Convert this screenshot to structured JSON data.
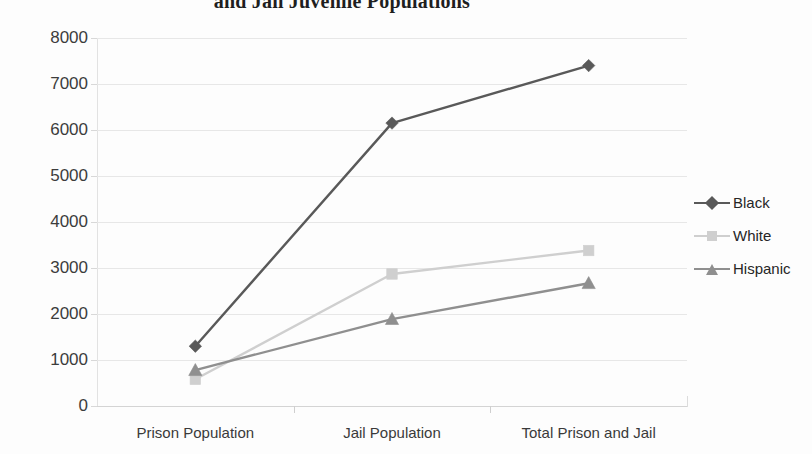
{
  "chart_data": {
    "type": "line",
    "title": "and Jail Juvenile Populations",
    "title_superscript": "2",
    "title_note": "Title is clipped at the top edge of the screenshot; only the second line is visible.",
    "xlabel": "",
    "ylabel": "",
    "categories": [
      "Prison Population",
      "Jail Population",
      "Total Prison and Jail"
    ],
    "ylim": [
      0,
      8000
    ],
    "ytick_step": 1000,
    "ytick_labels": [
      "8000",
      "7000",
      "6000",
      "5000",
      "4000",
      "3000",
      "2000",
      "1000",
      "0"
    ],
    "grid": true,
    "legend_position": "right",
    "series": [
      {
        "name": "Black",
        "values": [
          1300,
          6150,
          7400
        ],
        "color": "#595959",
        "marker": "diamond"
      },
      {
        "name": "White",
        "values": [
          580,
          2870,
          3380
        ],
        "color": "#cfcfcf",
        "marker": "square"
      },
      {
        "name": "Hispanic",
        "values": [
          780,
          1890,
          2670
        ],
        "color": "#8f8f8f",
        "marker": "triangle"
      }
    ]
  },
  "axis": {
    "y_ticks": [
      {
        "label": "8000",
        "value": 8000
      },
      {
        "label": "7000",
        "value": 7000
      },
      {
        "label": "6000",
        "value": 6000
      },
      {
        "label": "5000",
        "value": 5000
      },
      {
        "label": "4000",
        "value": 4000
      },
      {
        "label": "3000",
        "value": 3000
      },
      {
        "label": "2000",
        "value": 2000
      },
      {
        "label": "1000",
        "value": 1000
      },
      {
        "label": "0",
        "value": 0
      }
    ],
    "x_ticks": [
      {
        "label": "Prison Population"
      },
      {
        "label": "Jail Population"
      },
      {
        "label": "Total Prison and Jail"
      }
    ]
  },
  "legend": {
    "entries": [
      {
        "label": "Black",
        "color": "#595959",
        "marker": "diamond"
      },
      {
        "label": "White",
        "color": "#cfcfcf",
        "marker": "square"
      },
      {
        "label": "Hispanic",
        "color": "#8f8f8f",
        "marker": "triangle"
      }
    ]
  },
  "colors": {
    "background": "#fdfdfd",
    "gridline": "#e7e7e7",
    "axis": "#d4d4d4",
    "text": "#333333",
    "series_black": "#595959",
    "series_white": "#cfcfcf",
    "series_hispanic": "#8f8f8f"
  }
}
